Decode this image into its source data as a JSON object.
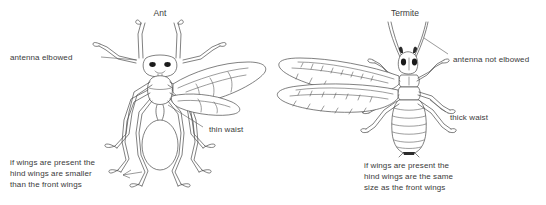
{
  "figure": {
    "type": "labeled-comparison-diagram",
    "background_color": "#ffffff",
    "line_color": "#4a4a4a",
    "text_color": "#3a3a3a"
  },
  "panels": [
    {
      "id": "ant",
      "title": "Ant",
      "labels": [
        {
          "id": "antenna",
          "text": "antenna elbowed"
        },
        {
          "id": "waist",
          "text": "thin waist"
        },
        {
          "id": "wings",
          "text": "if wings are present the\nhind wings are smaller\nthan the front wings"
        }
      ]
    },
    {
      "id": "termite",
      "title": "Termite",
      "labels": [
        {
          "id": "antenna",
          "text": "antenna not elbowed"
        },
        {
          "id": "waist",
          "text": "thick waist"
        },
        {
          "id": "wings",
          "text": "if wings are present the\nhind wings are the same\nsize as the front wings"
        }
      ]
    }
  ],
  "ant": {
    "title": "Ant",
    "label_antenna": "antenna elbowed",
    "label_waist": "thin waist",
    "label_wings_line1": "if wings are present the",
    "label_wings_line2": "hind wings are smaller",
    "label_wings_line3": "than the front wings"
  },
  "termite": {
    "title": "Termite",
    "label_antenna": "antenna not elbowed",
    "label_waist": "thick waist",
    "label_wings_line1": "if wings are present the",
    "label_wings_line2": "hind wings are the same",
    "label_wings_line3": "size as the front wings"
  }
}
